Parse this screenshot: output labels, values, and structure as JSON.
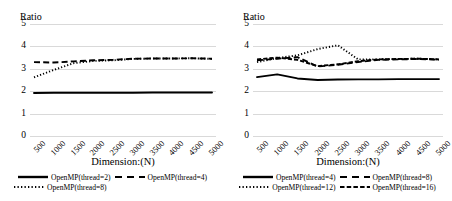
{
  "figure": {
    "background": "#ffffff",
    "line_color": "#000000",
    "grid_color": "#d9d9d9"
  },
  "chart_data": [
    {
      "type": "line",
      "title": "",
      "ylabel": "Ratio",
      "xlabel": "Dimension:(N)",
      "grid": true,
      "legend_position": "bottom",
      "ylim": [
        0,
        5
      ],
      "yticks": [
        "0",
        "1",
        "2",
        "3",
        "4",
        "5"
      ],
      "categories": [
        "500",
        "1000",
        "1500",
        "2000",
        "2500",
        "3000",
        "3500",
        "4000",
        "4500",
        "5000"
      ],
      "series": [
        {
          "name": "OpenMP(thread=2)",
          "dash": "solid",
          "values": [
            1.92,
            1.93,
            1.93,
            1.93,
            1.93,
            1.93,
            1.94,
            1.94,
            1.94,
            1.94
          ]
        },
        {
          "name": "OpenMP(thread=4)",
          "dash": "dashed",
          "values": [
            3.3,
            3.28,
            3.33,
            3.38,
            3.4,
            3.45,
            3.46,
            3.46,
            3.47,
            3.45
          ]
        },
        {
          "name": "OpenMP(thread=8)",
          "dash": "dotted",
          "values": [
            2.62,
            2.95,
            3.25,
            3.35,
            3.38,
            3.44,
            3.46,
            3.46,
            3.47,
            3.44
          ]
        }
      ]
    },
    {
      "type": "line",
      "title": "",
      "ylabel": "Ratio",
      "xlabel": "Dimension:(N)",
      "grid": true,
      "legend_position": "bottom",
      "ylim": [
        0,
        5
      ],
      "yticks": [
        "0",
        "1",
        "2",
        "3",
        "4",
        "5"
      ],
      "categories": [
        "500",
        "1000",
        "1500",
        "2000",
        "2500",
        "3000",
        "3500",
        "4000",
        "4500",
        "5000"
      ],
      "series": [
        {
          "name": "OpenMP(thread=4)",
          "dash": "solid",
          "values": [
            2.63,
            2.75,
            2.57,
            2.5,
            2.52,
            2.53,
            2.53,
            2.54,
            2.54,
            2.54
          ]
        },
        {
          "name": "OpenMP(thread=8)",
          "dash": "dashed",
          "values": [
            3.38,
            3.45,
            3.52,
            3.1,
            3.18,
            3.3,
            3.4,
            3.42,
            3.44,
            3.4
          ]
        },
        {
          "name": "OpenMP(thread=12)",
          "dash": "dotted",
          "values": [
            3.3,
            3.48,
            3.6,
            3.88,
            4.05,
            3.42,
            3.42,
            3.44,
            3.45,
            3.42
          ]
        },
        {
          "name": "OpenMP(thread=16)",
          "dash": "dashdot",
          "values": [
            3.42,
            3.5,
            3.4,
            3.12,
            3.2,
            3.34,
            3.42,
            3.44,
            3.45,
            3.42
          ]
        }
      ]
    }
  ]
}
